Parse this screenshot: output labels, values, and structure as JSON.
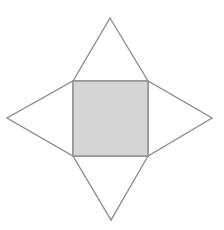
{
  "diagram": {
    "canvas": {
      "width": 224,
      "height": 230,
      "background": "#ffffff"
    },
    "stroke_color": "#8f8f8f",
    "stroke_width": 1.4,
    "base_square": {
      "x": 73,
      "y": 81,
      "width": 75,
      "height": 75,
      "fill": "#d5d5d5"
    },
    "triangles": [
      {
        "name": "top-face",
        "points": [
          [
            73,
            81
          ],
          [
            148,
            81
          ],
          [
            110,
            18
          ]
        ]
      },
      {
        "name": "right-face",
        "points": [
          [
            148,
            81
          ],
          [
            148,
            156
          ],
          [
            212,
            118
          ]
        ]
      },
      {
        "name": "bottom-face",
        "points": [
          [
            73,
            156
          ],
          [
            148,
            156
          ],
          [
            111,
            220
          ]
        ]
      },
      {
        "name": "left-face",
        "points": [
          [
            73,
            81
          ],
          [
            73,
            156
          ],
          [
            7,
            118
          ]
        ]
      }
    ],
    "triangle_fill": "#ffffff"
  }
}
